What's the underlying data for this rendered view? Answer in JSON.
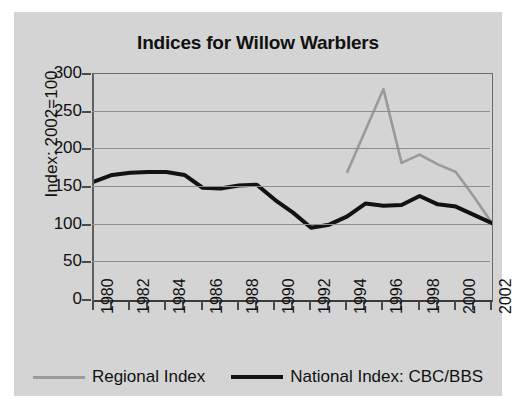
{
  "chart_data": {
    "type": "line",
    "title": "Indices for Willow Warblers",
    "xlabel": "",
    "ylabel": "Index: 2002=100",
    "xlim": [
      1980,
      2002
    ],
    "ylim": [
      0,
      300
    ],
    "yticks": [
      0,
      50,
      100,
      150,
      200,
      250,
      300
    ],
    "xticks": [
      1980,
      1982,
      1984,
      1986,
      1988,
      1990,
      1992,
      1994,
      1996,
      1998,
      2000,
      2002
    ],
    "xtick_labels": [
      "1980",
      "1982",
      "1984",
      "1986",
      "1988",
      "1990",
      "1992",
      "1994",
      "1996",
      "1998",
      "2000",
      "2002"
    ],
    "ytick_labels": [
      "0",
      "50",
      "100",
      "150",
      "200",
      "250",
      "300"
    ],
    "grid": true,
    "legend_position": "bottom",
    "x": [
      1980,
      1981,
      1982,
      1983,
      1984,
      1985,
      1986,
      1987,
      1988,
      1989,
      1990,
      1991,
      1992,
      1993,
      1994,
      1995,
      1996,
      1997,
      1998,
      1999,
      2000,
      2001,
      2002
    ],
    "series": [
      {
        "name": "Regional Index",
        "color": "#9a9a9a",
        "x": [
          1994,
          1995,
          1996,
          1997,
          1998,
          1999,
          2000,
          2001,
          2002
        ],
        "values": [
          170,
          225,
          280,
          182,
          193,
          180,
          170,
          137,
          102
        ]
      },
      {
        "name": "National Index: CBC/BBS",
        "color": "#121212",
        "x": [
          1980,
          1981,
          1982,
          1983,
          1984,
          1985,
          1986,
          1987,
          1988,
          1989,
          1990,
          1991,
          1992,
          1993,
          1994,
          1995,
          1996,
          1997,
          1998,
          1999,
          2000,
          2001,
          2002
        ],
        "values": [
          157,
          166,
          169,
          170,
          170,
          166,
          149,
          148,
          152,
          153,
          133,
          116,
          96,
          100,
          111,
          128,
          125,
          126,
          138,
          127,
          124,
          113,
          102
        ]
      }
    ]
  },
  "legend": {
    "items": [
      {
        "label": "Regional Index",
        "color": "#9a9a9a"
      },
      {
        "label": "National Index: CBC/BBS",
        "color": "#121212"
      }
    ]
  }
}
